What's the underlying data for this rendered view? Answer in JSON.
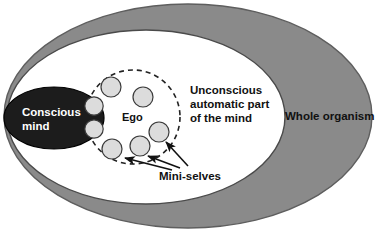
{
  "diagram": {
    "type": "nested-ellipse-concept-diagram",
    "colors": {
      "organism_fill": "#8a8a8a",
      "organism_stroke": "#5e5e5e",
      "unconscious_fill": "#ffffff",
      "unconscious_stroke": "#4a4a4a",
      "conscious_fill": "#1c1c1c",
      "conscious_stroke": "#000000",
      "ego_stroke": "#222222",
      "mini_self_fill": "#dcdcdc",
      "mini_self_stroke": "#3a3a3a",
      "label_dark": "#111111",
      "label_light": "#ffffff",
      "arrow_color": "#111111"
    },
    "regions": [
      {
        "key": "whole_organism",
        "label": "Whole organism",
        "shape": "ellipse",
        "fill": "#8a8a8a",
        "label_color": "#111111"
      },
      {
        "key": "unconscious",
        "label": "Unconscious\nautomatic part\nof the mind",
        "label_lines": [
          "Unconscious",
          "automatic part",
          "of the mind"
        ],
        "shape": "ellipse",
        "fill": "#ffffff",
        "label_color": "#111111"
      },
      {
        "key": "conscious",
        "label": "Conscious\nmind",
        "label_lines": [
          "Conscious",
          "mind"
        ],
        "shape": "ellipse",
        "fill": "#1c1c1c",
        "label_color": "#ffffff"
      },
      {
        "key": "ego",
        "label": "Ego",
        "shape": "dashed-circle",
        "fill": "none",
        "label_color": "#111111"
      }
    ],
    "labels": {
      "whole_organism": "Whole organism",
      "unconscious_line1": "Unconscious",
      "unconscious_line2": "automatic part",
      "unconscious_line3": "of the mind",
      "conscious_line1": "Conscious",
      "conscious_line2": "mind",
      "ego": "Ego",
      "mini_selves": "Mini-selves"
    },
    "mini_selves": {
      "label": "Mini-selves",
      "count_in_ego": 5,
      "count_in_conscious": 2,
      "total": 7,
      "annotated_by_arrows": 3
    },
    "arrows": [
      {
        "from": "mini-selves-label",
        "to": "mini-self-circle-bottom-left"
      },
      {
        "from": "mini-selves-label",
        "to": "mini-self-circle-bottom-center"
      },
      {
        "from": "mini-selves-label",
        "to": "mini-self-circle-right"
      }
    ]
  }
}
